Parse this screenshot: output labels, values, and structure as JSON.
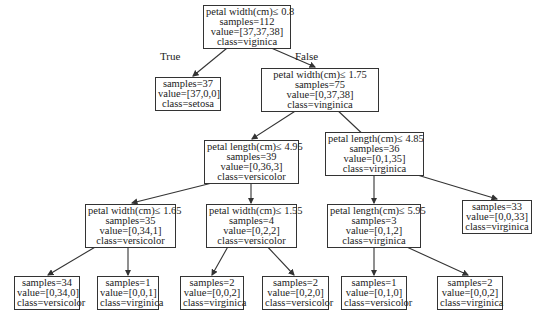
{
  "tree": {
    "nodes": [
      {
        "id": "root",
        "lines": [
          "petal width(cm)≤ 0.8",
          "samples=112",
          "value=[37,37,38]",
          "class=viginica"
        ]
      },
      {
        "id": "n1",
        "lines": [
          "samples=37",
          "value=[37,0,0]",
          "class=setosa"
        ]
      },
      {
        "id": "n2",
        "lines": [
          "petal width(cm)≤ 1.75",
          "samples=75",
          "value=[0,37,38]",
          "class=vinginica"
        ]
      },
      {
        "id": "n3",
        "lines": [
          "petal length(cm)≤ 4.95",
          "samples=39",
          "value=[0,36,3]",
          "class=versicolor"
        ]
      },
      {
        "id": "n4",
        "lines": [
          "petal length(cm)≤ 4.85",
          "samples=36",
          "value=[0,1,35]",
          "class=virginica"
        ]
      },
      {
        "id": "n5",
        "lines": [
          "petal width(cm)≤ 1.65",
          "samples=35",
          "value=[0,34,1]",
          "class=versicolor"
        ]
      },
      {
        "id": "n6",
        "lines": [
          "petal width(cm)≤ 1.55",
          "samples=4",
          "value=[0,2,2]",
          "class=versicolor"
        ]
      },
      {
        "id": "n7",
        "lines": [
          "petal length(cm)≤ 5.95",
          "samples=3",
          "value=[0,1,2]",
          "class=virginica"
        ]
      },
      {
        "id": "n8",
        "lines": [
          "samples=33",
          "value=[0,0,33]",
          "class=virginica"
        ]
      },
      {
        "id": "n9",
        "lines": [
          "samples=34",
          "value=[0,34,0]",
          "class=versicolor"
        ]
      },
      {
        "id": "n10",
        "lines": [
          "samples=1",
          "value=[0,0,1]",
          "class=virginica"
        ]
      },
      {
        "id": "n11",
        "lines": [
          "samples=2",
          "value=[0,0,2]",
          "class=virginica"
        ]
      },
      {
        "id": "n12",
        "lines": [
          "samples=2",
          "value=[0,2,0]",
          "class=versicolor"
        ]
      },
      {
        "id": "n13",
        "lines": [
          "samples=1",
          "value=[0,1,0]",
          "class=versicolor"
        ]
      },
      {
        "id": "n14",
        "lines": [
          "samples=2",
          "value=[0,0,2]",
          "class=virginica"
        ]
      }
    ],
    "edge_labels": {
      "true_label": "True",
      "false_label": "False"
    }
  }
}
